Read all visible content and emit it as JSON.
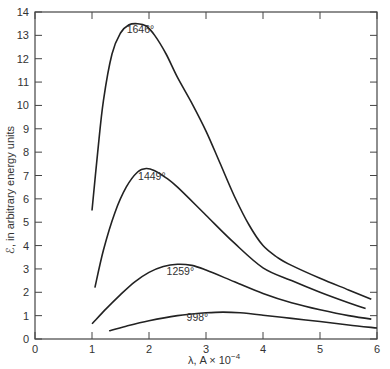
{
  "chart_data": {
    "type": "line",
    "title": "",
    "xlabel": "λ, A × 10⁻⁴",
    "ylabel": "ℰ, in arbitrary energy units",
    "xlim": [
      0,
      6
    ],
    "ylim": [
      0,
      14
    ],
    "x_ticks": [
      "0",
      "1",
      "2",
      "3",
      "4",
      "5",
      "6"
    ],
    "y_ticks": [
      "0",
      "1",
      "2",
      "3",
      "4",
      "5",
      "6",
      "7",
      "8",
      "9",
      "10",
      "11",
      "12",
      "13",
      "14"
    ],
    "grid": false,
    "legend": "inline curve labels",
    "series": [
      {
        "name": "1646°",
        "label_at": [
          1.85,
          13.1
        ],
        "x": [
          1.0,
          1.1,
          1.2,
          1.35,
          1.5,
          1.65,
          1.8,
          1.95,
          2.1,
          2.3,
          2.5,
          2.75,
          3.0,
          3.25,
          3.5,
          3.75,
          4.0,
          4.25,
          4.5,
          5.0,
          5.5,
          5.9
        ],
        "y": [
          5.5,
          8.0,
          10.2,
          12.2,
          13.1,
          13.45,
          13.5,
          13.4,
          13.0,
          12.2,
          11.2,
          10.1,
          8.9,
          7.5,
          6.1,
          4.9,
          4.0,
          3.5,
          3.15,
          2.6,
          2.1,
          1.7
        ]
      },
      {
        "name": "1449°",
        "label_at": [
          2.05,
          6.8
        ],
        "x": [
          1.05,
          1.2,
          1.4,
          1.6,
          1.8,
          1.95,
          2.1,
          2.3,
          2.5,
          3.0,
          3.5,
          4.0,
          4.5,
          5.0,
          5.5,
          5.8
        ],
        "y": [
          2.2,
          3.8,
          5.4,
          6.5,
          7.15,
          7.3,
          7.2,
          6.9,
          6.5,
          5.3,
          4.1,
          3.05,
          2.5,
          2.0,
          1.55,
          1.3
        ]
      },
      {
        "name": "1259°",
        "label_at": [
          2.55,
          2.75
        ],
        "x": [
          1.0,
          1.25,
          1.5,
          1.75,
          2.0,
          2.25,
          2.5,
          2.75,
          3.0,
          3.5,
          4.0,
          4.5,
          5.0,
          5.5,
          5.9
        ],
        "y": [
          0.65,
          1.3,
          1.9,
          2.45,
          2.85,
          3.1,
          3.2,
          3.15,
          2.95,
          2.45,
          1.95,
          1.55,
          1.25,
          1.0,
          0.85
        ]
      },
      {
        "name": "998°",
        "label_at": [
          2.85,
          0.75
        ],
        "x": [
          1.3,
          1.6,
          2.0,
          2.5,
          3.0,
          3.3,
          3.6,
          4.0,
          4.5,
          5.0,
          5.5,
          6.0
        ],
        "y": [
          0.35,
          0.55,
          0.78,
          1.0,
          1.12,
          1.15,
          1.12,
          1.02,
          0.88,
          0.75,
          0.6,
          0.47
        ]
      }
    ]
  },
  "axes": {
    "xlabel_prefix": "λ, A × 10",
    "xlabel_exp": "−4",
    "ylabel": "ℰ, in arbitrary energy units"
  },
  "colors": {
    "curve": "#222222",
    "axis": "#444444",
    "text": "#333333"
  }
}
